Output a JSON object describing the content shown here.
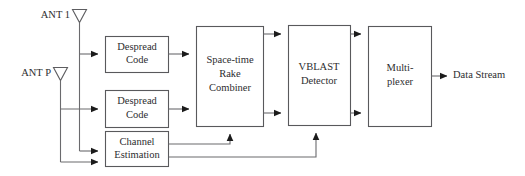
{
  "diagram": {
    "colors": {
      "background": "#ffffff",
      "box_stroke": "#59595c",
      "wire": "#6a6a6d",
      "arrow": "#1b1b1b",
      "text": "#2d2d2f"
    },
    "antennas": [
      {
        "id": "ant-1",
        "label": "ANT 1"
      },
      {
        "id": "ant-p",
        "label": "ANT P"
      }
    ],
    "blocks": [
      {
        "id": "despread-1",
        "line1": "Despread",
        "line2": "Code",
        "line3": ""
      },
      {
        "id": "despread-2",
        "line1": "Despread",
        "line2": "Code",
        "line3": ""
      },
      {
        "id": "channel-estimation",
        "line1": "Channel",
        "line2": "Estimation",
        "line3": ""
      },
      {
        "id": "space-time-rake-combiner",
        "line1": "Space-time",
        "line2": "Rake",
        "line3": "Combiner"
      },
      {
        "id": "vblast-detector",
        "line1": "VBLAST",
        "line2": "Detector",
        "line3": ""
      },
      {
        "id": "multiplexer",
        "line1": "Multi-",
        "line2": "plexer",
        "line3": ""
      }
    ],
    "outputs": [
      {
        "id": "data-stream",
        "label": "Data Stream"
      }
    ]
  }
}
